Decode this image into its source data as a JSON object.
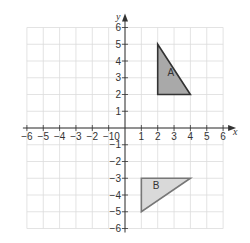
{
  "diagram": {
    "type": "coordinate-grid",
    "axes": {
      "x_label": "x",
      "y_label": "y",
      "x_range": [
        -6,
        6
      ],
      "y_range": [
        -6,
        6
      ],
      "origin_label": "0",
      "x_ticks": [
        -6,
        -5,
        -4,
        -3,
        -2,
        -1,
        1,
        2,
        3,
        4,
        5,
        6
      ],
      "y_ticks": [
        6,
        5,
        4,
        3,
        2,
        1,
        -1,
        -2,
        -3,
        -4,
        -5,
        -6
      ]
    },
    "shapes": [
      {
        "label": "A",
        "vertices": [
          [
            2,
            5
          ],
          [
            2,
            2
          ],
          [
            4,
            2
          ]
        ],
        "fill": "#a9a9a9",
        "stroke": "#333333",
        "label_pos": [
          2.6,
          3.1
        ]
      },
      {
        "label": "B",
        "vertices": [
          [
            1,
            -3
          ],
          [
            4,
            -3
          ],
          [
            1,
            -5
          ]
        ],
        "fill": "#d9d9d9",
        "stroke": "#777777",
        "label_pos": [
          1.7,
          -3.65
        ]
      }
    ],
    "colors": {
      "grid": "#dcdcdc",
      "axis": "#333333"
    }
  }
}
